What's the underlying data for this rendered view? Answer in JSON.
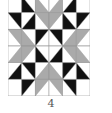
{
  "figure": {
    "label": "4",
    "grid": {
      "rows": 6,
      "cols": 6
    },
    "colors": {
      "B": "#111111",
      "G": "#aaaaaa",
      "W": "#ffffff",
      "line": "#9a9a9a"
    },
    "legend_note": "Each cell: [triangle_half, color] — UL/UR/LL/LR = half filled; W = plain white",
    "cells": [
      [
        "W",
        [
          "LL",
          "B"
        ],
        [
          "LL",
          "G"
        ],
        [
          "LR",
          "G"
        ],
        [
          "LR",
          "B"
        ],
        "W"
      ],
      [
        [
          "UR",
          "B"
        ],
        [
          "LR",
          "B"
        ],
        [
          "UR",
          "G"
        ],
        [
          "UL",
          "G"
        ],
        [
          "LL",
          "B"
        ],
        [
          "UL",
          "B"
        ]
      ],
      [
        [
          "UR",
          "G"
        ],
        [
          "LL",
          "G"
        ],
        [
          "UL",
          "B"
        ],
        [
          "UR",
          "B"
        ],
        [
          "LR",
          "G"
        ],
        [
          "UL",
          "G"
        ]
      ],
      [
        [
          "LR",
          "G"
        ],
        [
          "UL",
          "G"
        ],
        [
          "LL",
          "B"
        ],
        [
          "LR",
          "B"
        ],
        [
          "UR",
          "G"
        ],
        [
          "LL",
          "G"
        ]
      ],
      [
        [
          "LR",
          "B"
        ],
        [
          "UR",
          "B"
        ],
        [
          "LR",
          "G"
        ],
        [
          "LL",
          "G"
        ],
        [
          "UL",
          "B"
        ],
        [
          "LL",
          "B"
        ]
      ],
      [
        "W",
        [
          "UL",
          "B"
        ],
        [
          "UL",
          "G"
        ],
        [
          "UR",
          "G"
        ],
        [
          "UR",
          "B"
        ],
        "W"
      ]
    ]
  }
}
